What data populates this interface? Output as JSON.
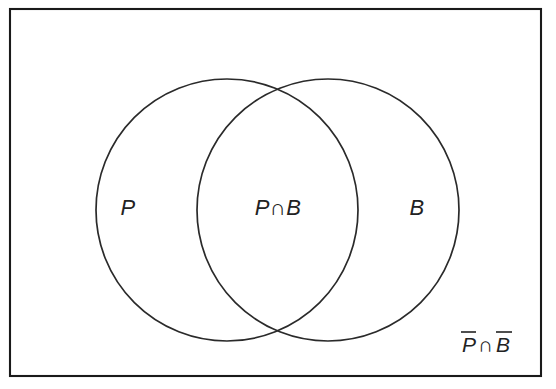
{
  "figure": {
    "type": "venn-diagram",
    "background_color": "#ffffff",
    "stroke_color": "#222222",
    "frame": {
      "name": "universal-set-rectangle",
      "x": 10,
      "y": 9,
      "width": 531,
      "height": 367
    }
  },
  "sets": [
    {
      "id": "P",
      "label": "P",
      "label_x": 128,
      "label_y": 215,
      "circle": {
        "cx": 227,
        "cy": 210,
        "r": 131
      }
    },
    {
      "id": "B",
      "label": "B",
      "label_x": 417,
      "label_y": 215,
      "circle": {
        "cx": 328,
        "cy": 210,
        "r": 131
      }
    }
  ],
  "regions": [
    {
      "id": "intersection",
      "label": "P∩B",
      "label_x": 278,
      "label_y": 215,
      "description": "overlap of P and B"
    },
    {
      "id": "complement",
      "label_parts": {
        "first": "P",
        "operator": "∩",
        "second": "B"
      },
      "label_full": "P̄∩B̄",
      "label_x": 462,
      "label_y": 352,
      "description": "outside both circles"
    }
  ],
  "symbols": {
    "intersection": "∩",
    "complement_overbar": "̄"
  }
}
